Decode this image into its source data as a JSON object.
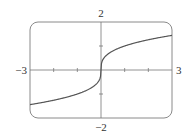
{
  "chart_data": {
    "type": "line",
    "title": "",
    "function": "y = x^(1/3)",
    "xlabel": "",
    "ylabel": "",
    "xlim": [
      -3,
      3
    ],
    "ylim": [
      -2,
      2
    ],
    "grid": false,
    "legend": null,
    "tick_labels": {
      "x_min": "−3",
      "x_max": "3",
      "y_max": "2",
      "y_min": "−2"
    },
    "x_ticks": [
      -2,
      -1,
      1,
      2
    ],
    "y_ticks": [
      -1,
      1
    ],
    "series": [
      {
        "name": "cube root",
        "x": [
          -3,
          -2.5,
          -2,
          -1.5,
          -1,
          -0.5,
          -0.25,
          -0.1,
          -0.02,
          0,
          0.02,
          0.1,
          0.25,
          0.5,
          1,
          1.5,
          2,
          2.5,
          3
        ],
        "values": [
          -1.442,
          -1.357,
          -1.26,
          -1.145,
          -1.0,
          -0.794,
          -0.63,
          -0.464,
          -0.271,
          0,
          0.271,
          0.464,
          0.63,
          0.794,
          1.0,
          1.145,
          1.26,
          1.357,
          1.442
        ]
      }
    ],
    "colors": {
      "curve": "#555555",
      "axes": "#777777",
      "frame": "#888888"
    }
  }
}
